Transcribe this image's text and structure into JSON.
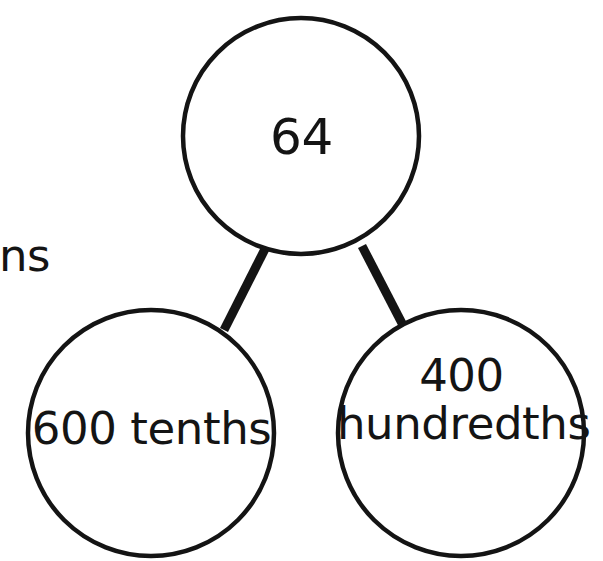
{
  "diagram": {
    "type": "number-bond",
    "stroke_color": "#141414",
    "fill_color": "#ffffff",
    "text_color": "#141414",
    "nodes": {
      "total": {
        "label": "64",
        "role": "whole",
        "cx": 301,
        "cy": 136,
        "r": 118
      },
      "part_left": {
        "label": "600 tenths",
        "role": "part",
        "cx": 151,
        "cy": 433,
        "r": 123
      },
      "part_right": {
        "label_line1": "400",
        "label_line2": "hundredths",
        "label": "400 hundredths",
        "role": "part",
        "cx": 461,
        "cy": 433,
        "r": 123
      }
    },
    "connectors": [
      {
        "name": "total-to-left-part",
        "from": "total",
        "to": "part_left",
        "width": 9
      },
      {
        "name": "total-to-right-part",
        "from": "total",
        "to": "part_right",
        "width": 9
      }
    ],
    "clipped_text": "ns"
  }
}
